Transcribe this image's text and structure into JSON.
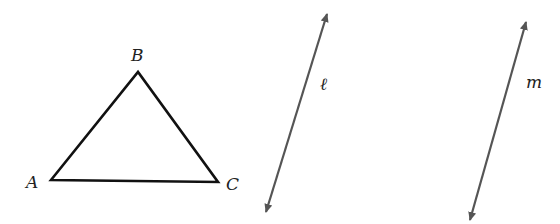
{
  "diagram": {
    "triangle": {
      "vertices": [
        {
          "name": "A",
          "x": 51,
          "y": 180,
          "label_x": 26,
          "label_y": 188
        },
        {
          "name": "B",
          "x": 138,
          "y": 72,
          "label_x": 131,
          "label_y": 61
        },
        {
          "name": "C",
          "x": 218,
          "y": 182,
          "label_x": 226,
          "label_y": 190
        }
      ]
    },
    "lines": [
      {
        "name": "ℓ",
        "x1": 266,
        "y1": 212,
        "x2": 327,
        "y2": 14,
        "label_x": 320,
        "label_y": 90
      },
      {
        "name": "m",
        "x1": 470,
        "y1": 220,
        "x2": 526,
        "y2": 22,
        "label_x": 526,
        "label_y": 88
      }
    ],
    "colors": {
      "triangle": "#111111",
      "lines": "#555555"
    }
  }
}
